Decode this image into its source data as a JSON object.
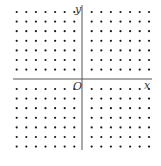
{
  "diagram": {
    "type": "coordinate-lattice",
    "axes": {
      "x_label": "x",
      "y_label": "y",
      "origin_label": "O",
      "color": "#555555",
      "x_axis": {
        "y": 79,
        "x_start": 13,
        "x_end": 152
      },
      "y_axis": {
        "x": 82,
        "y_start": 5,
        "y_end": 150
      }
    },
    "dots": {
      "color": "#1a1a1a",
      "radius": 1.1,
      "columns_left": [
        16.7,
        26.3,
        35.9,
        45.5,
        55.1,
        64.7,
        74.3
      ],
      "columns_right": [
        91.7,
        101.3,
        110.9,
        120.5,
        130.1,
        139.7,
        149.0
      ],
      "rows_top": [
        12,
        21.6,
        31.2,
        40.8,
        50.4,
        60,
        69.6
      ],
      "rows_bottom": [
        89,
        98.6,
        108.2,
        117.8,
        127.4,
        137,
        146.6
      ]
    },
    "quadrants": [
      {
        "name": "II",
        "cols": 7,
        "rows": 7
      },
      {
        "name": "I",
        "cols": 7,
        "rows": 7
      },
      {
        "name": "III",
        "cols": 7,
        "rows": 7
      },
      {
        "name": "IV",
        "cols": 7,
        "rows": 7
      }
    ]
  }
}
